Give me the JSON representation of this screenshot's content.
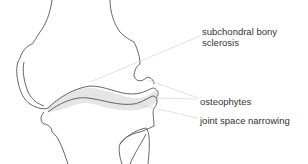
{
  "diagram": {
    "labels": {
      "sclerosis_line1": "subchondral bony",
      "sclerosis_line2": "sclerosis",
      "osteophytes": "osteophytes",
      "narrowing": "joint space narrowing"
    },
    "colors": {
      "outline": "#555555",
      "leader": "#cccccc",
      "stipple": "#d8d8d8",
      "text": "#333333"
    }
  }
}
